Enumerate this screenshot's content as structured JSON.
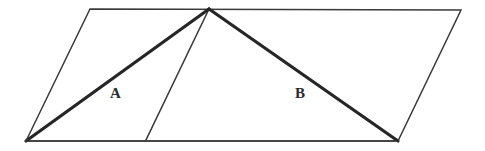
{
  "figure": {
    "background_color": "#ffffff",
    "width": 485,
    "height": 151,
    "thin_stroke_color": "#3a3a3a",
    "thick_stroke_color": "#262626",
    "thin_stroke_width": 1.5,
    "thick_stroke_width": 3.2,
    "parallelogram": {
      "name": "outer-parallelogram",
      "points": "26,141 90,9 461,10 398,141",
      "vertices": [
        {
          "label": "bottom-left",
          "x": 26,
          "y": 141
        },
        {
          "label": "top-left",
          "x": 90,
          "y": 9
        },
        {
          "label": "top-right",
          "x": 461,
          "y": 10
        },
        {
          "label": "bottom-right",
          "x": 398,
          "y": 141
        }
      ]
    },
    "apex": {
      "x": 209,
      "y": 9
    },
    "divider_foot": {
      "x": 146,
      "y": 140
    },
    "triangle_a": {
      "name": "triangle-a",
      "label": "A",
      "points": "26,141 209,9 146,140",
      "heavy_edges": [
        {
          "name": "a-hypotenuse",
          "x1": 26,
          "y1": 141,
          "x2": 209,
          "y2": 9
        }
      ],
      "thin_edges": [
        {
          "name": "a-divider",
          "x1": 209,
          "y1": 9,
          "x2": 146,
          "y2": 140
        }
      ],
      "label_position": {
        "x": 110,
        "y": 86
      }
    },
    "triangle_b": {
      "name": "triangle-b",
      "label": "B",
      "points": "209,9 398,141 146,140",
      "heavy_edges": [
        {
          "name": "b-hypotenuse",
          "x1": 209,
          "y1": 9,
          "x2": 398,
          "y2": 141
        }
      ],
      "label_position": {
        "x": 295,
        "y": 86
      }
    },
    "base_line": {
      "name": "base-edge",
      "x1": 26,
      "y1": 141,
      "x2": 398,
      "y2": 141
    },
    "top_line": {
      "name": "top-edge",
      "x1": 90,
      "y1": 9,
      "x2": 461,
      "y2": 10
    },
    "left_slant": {
      "name": "left-slant-edge",
      "x1": 26,
      "y1": 141,
      "x2": 90,
      "y2": 9
    },
    "right_slant": {
      "name": "right-slant-edge",
      "x1": 398,
      "y1": 141,
      "x2": 461,
      "y2": 10
    }
  }
}
